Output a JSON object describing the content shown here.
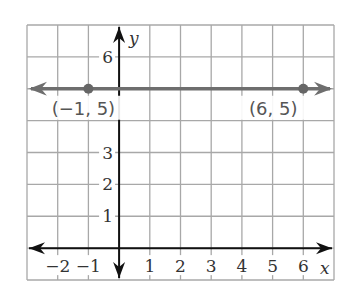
{
  "chart_data": {
    "type": "line",
    "title": "",
    "xlabel": "x",
    "ylabel": "y",
    "xlim": [
      -3,
      7
    ],
    "ylim": [
      -1,
      7
    ],
    "grid": true,
    "x_tick_labels": [
      "−2",
      "−1",
      "1",
      "2",
      "3",
      "4",
      "5",
      "6"
    ],
    "x_ticks": [
      -2,
      -1,
      1,
      2,
      3,
      4,
      5,
      6
    ],
    "y_tick_labels": [
      "1",
      "2",
      "3",
      "6"
    ],
    "y_ticks": [
      1,
      2,
      3,
      6
    ],
    "series": [
      {
        "name": "horizontal line y = 5",
        "x": [
          -1,
          6
        ],
        "y": [
          5,
          5
        ],
        "extends_both_directions": true,
        "color": "#6e6e6e"
      }
    ],
    "points": [
      {
        "x": -1,
        "y": 5,
        "label": "(−1, 5)"
      },
      {
        "x": 6,
        "y": 5,
        "label": "(6, 5)"
      }
    ],
    "colors": {
      "grid": "#a8a8a8",
      "axes": "#111111",
      "line": "#6e6e6e"
    }
  }
}
